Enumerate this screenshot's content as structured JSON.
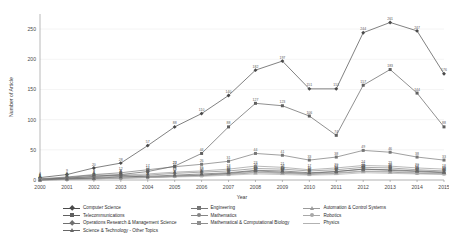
{
  "chart_data": {
    "type": "line",
    "title": "",
    "xlabel": "Year",
    "ylabel": "Number of Article",
    "categories": [
      2000,
      2001,
      2002,
      2003,
      2004,
      2005,
      2006,
      2007,
      2008,
      2009,
      2010,
      2011,
      2012,
      2013,
      2014,
      2015
    ],
    "x": [
      "2000",
      "2001",
      "2002",
      "2003",
      "2004",
      "2005",
      "2006",
      "2007",
      "2008",
      "2009",
      "2010",
      "2011",
      "2012",
      "2013",
      "2014",
      "2015"
    ],
    "ylim": [
      0,
      275
    ],
    "yticks": [
      0,
      50,
      100,
      150,
      200,
      250
    ],
    "grid": true,
    "legend_position": "bottom",
    "series": [
      {
        "name": "Computer Science",
        "color": "#4a4a4a",
        "marker": "diamond",
        "values": [
          4,
          9,
          20,
          28,
          57,
          88,
          110,
          140,
          182,
          197,
          151,
          151,
          244,
          261,
          247,
          176
        ]
      },
      {
        "name": "Engineering",
        "color": "#777777",
        "marker": "square",
        "values": [
          2,
          5,
          9,
          12,
          17,
          22,
          26,
          31,
          44,
          41,
          33,
          38,
          49,
          46,
          38,
          33
        ]
      },
      {
        "name": "Automation & Control Systems",
        "color": "#9a9a9a",
        "marker": "triangle",
        "values": [
          1,
          3,
          5,
          8,
          10,
          13,
          15,
          18,
          23,
          21,
          17,
          20,
          24,
          23,
          20,
          18
        ]
      },
      {
        "name": "Telecommunications",
        "color": "#606060",
        "marker": "square",
        "values": [
          1,
          3,
          6,
          9,
          14,
          23,
          44,
          88,
          127,
          123,
          106,
          74,
          157,
          183,
          144,
          88
        ]
      },
      {
        "name": "Mathematics",
        "color": "#858585",
        "marker": "circle",
        "values": [
          1,
          2,
          4,
          6,
          8,
          11,
          13,
          15,
          19,
          18,
          15,
          17,
          21,
          20,
          17,
          15
        ]
      },
      {
        "name": "Robotics",
        "color": "#a8a8a8",
        "marker": "circle",
        "values": [
          0,
          1,
          2,
          3,
          5,
          7,
          8,
          10,
          13,
          12,
          10,
          12,
          15,
          14,
          12,
          11
        ]
      },
      {
        "name": "Operations Research & Management Science",
        "color": "#707070",
        "marker": "diamond",
        "values": [
          1,
          4,
          8,
          8,
          4,
          6,
          8,
          11,
          15,
          13,
          11,
          14,
          18,
          16,
          14,
          12
        ]
      },
      {
        "name": "Mathematical & Computational Biology",
        "color": "#8f8f8f",
        "marker": "square",
        "values": [
          0,
          1,
          2,
          3,
          4,
          6,
          7,
          9,
          12,
          11,
          9,
          11,
          14,
          13,
          11,
          10
        ]
      },
      {
        "name": "Physics",
        "color": "#b2b2b2",
        "marker": "dash",
        "values": [
          0,
          1,
          2,
          3,
          4,
          5,
          6,
          8,
          10,
          9,
          8,
          9,
          12,
          11,
          10,
          9
        ]
      },
      {
        "name": "Science & Technology - Other Topics",
        "color": "#666666",
        "marker": "triangle",
        "values": [
          0,
          2,
          3,
          5,
          6,
          8,
          10,
          12,
          16,
          15,
          12,
          14,
          18,
          17,
          15,
          13
        ]
      }
    ],
    "point_labels_shown": true
  },
  "legend": {
    "columns": [
      [
        "Computer Science",
        "Telecommunications",
        "Operations Research & Management Science",
        "Science & Technology - Other Topics"
      ],
      [
        "Engineering",
        "Mathematics",
        "Mathematical & Computational Biology"
      ],
      [
        "Automation & Control Systems",
        "Robotics",
        "Physics"
      ]
    ]
  }
}
